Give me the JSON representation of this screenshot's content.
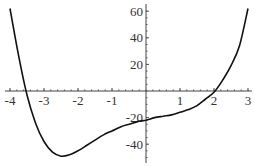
{
  "chart_data": {
    "type": "line",
    "title": "",
    "xlabel": "",
    "ylabel": "",
    "xlim": [
      -4.1,
      3.05
    ],
    "ylim": [
      -52,
      64
    ],
    "grid": false,
    "legend": null,
    "x_ticks": [
      -4,
      -3,
      -2,
      -1,
      1,
      2,
      3
    ],
    "y_ticks": [
      60,
      40,
      20,
      -20,
      -40
    ],
    "x_tick_labels": [
      "-4",
      "-3",
      "-2",
      "-1",
      "1",
      "2",
      "3"
    ],
    "y_tick_labels": [
      "60",
      "40",
      "20",
      "-20",
      "-40"
    ],
    "series": [
      {
        "name": "f(x)",
        "color": "#111111",
        "x": [
          -4.0,
          -3.75,
          -3.5,
          -3.25,
          -3.0,
          -2.75,
          -2.5,
          -2.25,
          -2.0,
          -1.75,
          -1.5,
          -1.25,
          -1.0,
          -0.75,
          -0.5,
          -0.25,
          0.0,
          0.25,
          0.5,
          0.75,
          1.0,
          1.25,
          1.5,
          1.75,
          2.0,
          2.25,
          2.5,
          2.75,
          3.0
        ],
        "y": [
          62,
          27,
          -3,
          -24,
          -38,
          -46,
          -49,
          -48,
          -45,
          -41,
          -37,
          -33,
          -30,
          -27,
          -25,
          -23,
          -22,
          -20,
          -19,
          -18,
          -16,
          -14,
          -11,
          -6,
          -1,
          8,
          19,
          34,
          62
        ]
      }
    ]
  },
  "plot_area": {
    "x_origin_px": 146,
    "y_origin_px": 91,
    "px_per_x_unit": 34,
    "px_per_y_unit": 1.33,
    "x_axis_left_px": 5,
    "x_axis_right_px": 252,
    "y_axis_top_px": 4,
    "y_axis_bottom_px": 163
  }
}
